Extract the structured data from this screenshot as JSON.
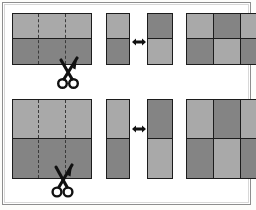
{
  "figure": {
    "title": "Cut and rearrange strips to form a checkerboard",
    "background_color": "#ffffff",
    "frame_color": "#8e8e8e",
    "ink_color": "#1c1c1c",
    "shade_light": "#a9a9a9",
    "shade_dark": "#848484",
    "rows": [
      {
        "row_label": "Top row: horizontal seam, vertical cuts",
        "step_1": {
          "caption": "Rectangle with horizontal seam and two vertical dotted cut lines",
          "seam_orientation": "horizontal",
          "cut_lines": 2,
          "cut_line_style": "dotted",
          "bands": [
            {
              "position": "top",
              "shade": "#a9a9a9"
            },
            {
              "position": "bottom",
              "shade": "#848484"
            }
          ],
          "tool": "scissors-icon"
        },
        "step_2": {
          "caption": "Two cut strips shown side by side, offset by one band",
          "strips": [
            {
              "name": "strip-a",
              "top_shade": "#a9a9a9",
              "bottom_shade": "#848484"
            },
            {
              "name": "strip-b",
              "top_shade": "#848484",
              "bottom_shade": "#a9a9a9"
            }
          ],
          "connector": "double-arrow-icon"
        },
        "step_3": {
          "caption": "Assembled checkerboard of six squares",
          "grid": {
            "columns": 3,
            "rows": 2,
            "cells": [
              [
                "#a9a9a9",
                "#848484",
                "#a9a9a9"
              ],
              [
                "#848484",
                "#a9a9a9",
                "#848484"
              ]
            ]
          }
        }
      },
      {
        "row_label": "Bottom row: wider bands, taller strips",
        "step_1": {
          "caption": "Rectangle with horizontal seam and two vertical dotted cut lines",
          "seam_orientation": "horizontal",
          "cut_lines": 2,
          "cut_line_style": "dotted",
          "bands": [
            {
              "position": "top",
              "shade": "#a9a9a9"
            },
            {
              "position": "bottom",
              "shade": "#848484"
            }
          ],
          "tool": "scissors-icon"
        },
        "step_2": {
          "caption": "Two tall cut strips shown side by side, offset by one band",
          "strips": [
            {
              "name": "strip-a",
              "top_shade": "#a9a9a9",
              "bottom_shade": "#848484"
            },
            {
              "name": "strip-b",
              "top_shade": "#848484",
              "bottom_shade": "#a9a9a9"
            }
          ],
          "connector": "double-arrow-icon"
        },
        "step_3": {
          "caption": "Assembled checkerboard of six tall rectangles",
          "grid": {
            "columns": 3,
            "rows": 2,
            "cells": [
              [
                "#a9a9a9",
                "#848484",
                "#a9a9a9"
              ],
              [
                "#848484",
                "#a9a9a9",
                "#848484"
              ]
            ]
          }
        }
      }
    ],
    "icons": {
      "scissors": "scissors-icon",
      "double_arrow": "double-arrow-icon"
    }
  }
}
